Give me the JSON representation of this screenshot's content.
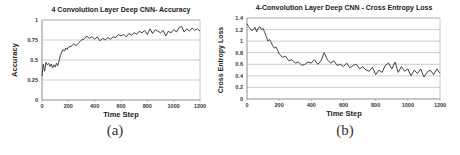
{
  "chart_data": [
    {
      "type": "line",
      "title": "4 Convolution Layer Deep CNN- Accuracy",
      "xlabel": "Time Step",
      "ylabel": "Accuracy",
      "xlim": [
        0,
        1200
      ],
      "ylim": [
        0,
        1
      ],
      "xticks": [
        0,
        200,
        400,
        600,
        800,
        1000,
        1200
      ],
      "yticks": [
        0,
        0.25,
        0.5,
        0.75,
        1
      ],
      "ytick_labels": [
        "0",
        "0.25",
        "0.5",
        "0.75",
        "1"
      ],
      "grid": "horizontal",
      "caption": "(a)",
      "series": [
        {
          "name": "Accuracy",
          "color": "#444444",
          "x": [
            0,
            10,
            20,
            30,
            40,
            50,
            60,
            70,
            80,
            90,
            100,
            110,
            120,
            130,
            140,
            150,
            160,
            170,
            180,
            190,
            200,
            220,
            240,
            260,
            280,
            300,
            320,
            340,
            360,
            380,
            400,
            420,
            440,
            460,
            480,
            500,
            520,
            540,
            560,
            580,
            600,
            620,
            640,
            660,
            680,
            700,
            720,
            740,
            760,
            780,
            800,
            820,
            840,
            860,
            880,
            900,
            920,
            940,
            960,
            980,
            1000,
            1020,
            1040,
            1060,
            1080,
            1100,
            1120,
            1140,
            1160,
            1180,
            1200
          ],
          "values": [
            0.3,
            0.45,
            0.36,
            0.47,
            0.44,
            0.46,
            0.42,
            0.45,
            0.4,
            0.44,
            0.41,
            0.46,
            0.43,
            0.49,
            0.56,
            0.6,
            0.63,
            0.61,
            0.65,
            0.63,
            0.66,
            0.67,
            0.7,
            0.68,
            0.72,
            0.75,
            0.76,
            0.8,
            0.77,
            0.79,
            0.76,
            0.79,
            0.74,
            0.77,
            0.75,
            0.78,
            0.76,
            0.79,
            0.78,
            0.82,
            0.8,
            0.82,
            0.79,
            0.83,
            0.81,
            0.84,
            0.82,
            0.86,
            0.84,
            0.87,
            0.82,
            0.89,
            0.83,
            0.88,
            0.86,
            0.84,
            0.87,
            0.8,
            0.86,
            0.84,
            0.88,
            0.85,
            0.9,
            0.92,
            0.85,
            0.89,
            0.86,
            0.9,
            0.87,
            0.89,
            0.86
          ]
        }
      ]
    },
    {
      "type": "line",
      "title": "4-Convolution Layer Deep CNN - Cross Entropy Loss",
      "xlabel": "Time Step",
      "ylabel": "Cross Entropy Loss",
      "xlim": [
        0,
        1200
      ],
      "ylim": [
        0,
        1.4
      ],
      "xticks": [
        0,
        200,
        400,
        600,
        800,
        1000,
        1200
      ],
      "yticks": [
        0,
        0.2,
        0.4,
        0.6,
        0.8,
        1,
        1.2,
        1.4
      ],
      "ytick_labels": [
        "0",
        "0.2",
        "0.4",
        "0.6",
        "0.8",
        "1",
        "1.2",
        "1.4"
      ],
      "grid": "horizontal",
      "caption": "(b)",
      "series": [
        {
          "name": "Cross Entropy Loss",
          "color": "#444444",
          "x": [
            0,
            10,
            20,
            30,
            40,
            50,
            60,
            70,
            80,
            90,
            100,
            110,
            120,
            130,
            140,
            150,
            160,
            170,
            180,
            190,
            200,
            220,
            240,
            260,
            280,
            300,
            320,
            340,
            360,
            380,
            400,
            420,
            440,
            460,
            480,
            500,
            520,
            540,
            560,
            580,
            600,
            620,
            640,
            660,
            680,
            700,
            720,
            740,
            760,
            780,
            800,
            820,
            840,
            860,
            880,
            900,
            920,
            940,
            960,
            980,
            1000,
            1020,
            1040,
            1060,
            1080,
            1100,
            1120,
            1140,
            1160,
            1180,
            1200
          ],
          "values": [
            1.3,
            1.25,
            1.22,
            1.18,
            1.2,
            1.24,
            1.16,
            1.23,
            1.25,
            1.2,
            1.22,
            1.15,
            1.08,
            1.0,
            1.03,
            0.98,
            0.92,
            0.88,
            0.9,
            0.84,
            0.78,
            0.72,
            0.74,
            0.66,
            0.68,
            0.62,
            0.64,
            0.58,
            0.6,
            0.64,
            0.62,
            0.68,
            0.6,
            0.66,
            0.8,
            0.68,
            0.62,
            0.66,
            0.58,
            0.6,
            0.56,
            0.62,
            0.54,
            0.58,
            0.6,
            0.52,
            0.56,
            0.5,
            0.48,
            0.55,
            0.42,
            0.5,
            0.46,
            0.58,
            0.62,
            0.52,
            0.64,
            0.46,
            0.56,
            0.48,
            0.52,
            0.4,
            0.5,
            0.44,
            0.52,
            0.38,
            0.46,
            0.5,
            0.42,
            0.52,
            0.44
          ]
        }
      ]
    }
  ]
}
